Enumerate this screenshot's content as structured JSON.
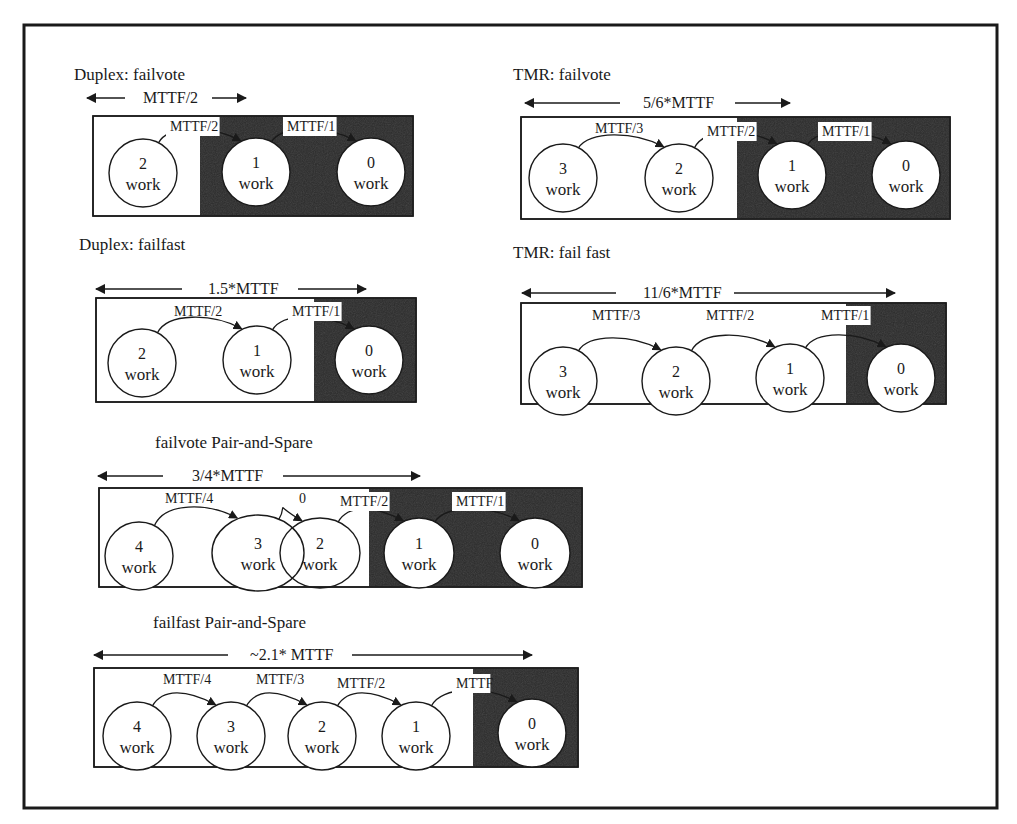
{
  "figure": {
    "frame": {
      "x": 24,
      "y": 25,
      "w": 973,
      "h": 783
    },
    "colors": {
      "dark": "#2a2a2a",
      "line": "#1a1a1a",
      "paper": "#ffffff"
    }
  },
  "diagrams": [
    {
      "id": "duplex-failvote",
      "title": "Duplex: failvote",
      "title_pos": [
        74,
        80
      ],
      "span_label": "MTTF/2",
      "span": {
        "x1": 87,
        "x2": 246,
        "y": 98,
        "label_x": 143,
        "left_end": 125,
        "right_start": 212
      },
      "box": {
        "x": 93,
        "y": 116,
        "w": 320,
        "h": 100
      },
      "dark_from": 200,
      "nodes": [
        {
          "num": "2",
          "word": "work",
          "cx": 143,
          "cy": 173
        },
        {
          "num": "1",
          "word": "work",
          "cx": 256,
          "cy": 172
        },
        {
          "num": "0",
          "word": "work",
          "cx": 371,
          "cy": 172
        }
      ],
      "rates": [
        {
          "label": "MTTF/2",
          "x": 170,
          "y": 131,
          "bg": true
        },
        {
          "label": "MTTF/1",
          "x": 287,
          "y": 131,
          "bg": true
        }
      ]
    },
    {
      "id": "tmr-failvote",
      "title": "TMR: failvote",
      "title_pos": [
        513,
        80
      ],
      "span_label": "5/6*MTTF",
      "span": {
        "x1": 525,
        "x2": 790,
        "y": 103,
        "label_x": 643,
        "left_end": 620,
        "right_start": 735
      },
      "box": {
        "x": 521,
        "y": 117,
        "w": 429,
        "h": 102
      },
      "dark_from": 737,
      "nodes": [
        {
          "num": "3",
          "word": "work",
          "cx": 563,
          "cy": 178
        },
        {
          "num": "2",
          "word": "work",
          "cx": 679,
          "cy": 178
        },
        {
          "num": "1",
          "word": "work",
          "cx": 792,
          "cy": 175
        },
        {
          "num": "0",
          "word": "work",
          "cx": 906,
          "cy": 175
        }
      ],
      "rates": [
        {
          "label": "MTTF/3",
          "x": 595,
          "y": 133,
          "bg": false
        },
        {
          "label": "MTTF/2",
          "x": 707,
          "y": 136,
          "bg": true
        },
        {
          "label": "MTTF/1",
          "x": 822,
          "y": 136,
          "bg": true
        }
      ]
    },
    {
      "id": "duplex-failfast",
      "title": "Duplex: failfast",
      "title_pos": [
        79,
        250
      ],
      "span_label": "1.5*MTTF",
      "span": {
        "x1": 96,
        "x2": 366,
        "y": 289,
        "label_x": 208,
        "left_end": 182,
        "right_start": 298
      },
      "box": {
        "x": 96,
        "y": 298,
        "w": 320,
        "h": 104
      },
      "dark_from": 314,
      "nodes": [
        {
          "num": "2",
          "word": "work",
          "cx": 142,
          "cy": 363
        },
        {
          "num": "1",
          "word": "work",
          "cx": 257,
          "cy": 360
        },
        {
          "num": "0",
          "word": "work",
          "cx": 369,
          "cy": 360
        }
      ],
      "rates": [
        {
          "label": "MTTF/2",
          "x": 174,
          "y": 316,
          "bg": false
        },
        {
          "label": "MTTF/1",
          "x": 292,
          "y": 316,
          "bg": true
        }
      ]
    },
    {
      "id": "tmr-failfast",
      "title": "TMR: fail fast",
      "title_pos": [
        513,
        258
      ],
      "span_label": "11/6*MTTF",
      "span": {
        "x1": 522,
        "x2": 895,
        "y": 293,
        "label_x": 643,
        "left_end": 616,
        "right_start": 734
      },
      "box": {
        "x": 521,
        "y": 303,
        "w": 425,
        "h": 101
      },
      "dark_from": 846,
      "nodes": [
        {
          "num": "3",
          "word": "work",
          "cx": 563,
          "cy": 381
        },
        {
          "num": "2",
          "word": "work",
          "cx": 676,
          "cy": 381
        },
        {
          "num": "1",
          "word": "work",
          "cx": 790,
          "cy": 378
        },
        {
          "num": "0",
          "word": "work",
          "cx": 901,
          "cy": 378
        }
      ],
      "rates": [
        {
          "label": "MTTF/3",
          "x": 592,
          "y": 320,
          "bg": false
        },
        {
          "label": "MTTF/2",
          "x": 706,
          "y": 320,
          "bg": false
        },
        {
          "label": "MTTF/1",
          "x": 821,
          "y": 320,
          "bg": true
        }
      ]
    },
    {
      "id": "failvote-pair-and-spare",
      "title": "failvote   Pair-and-Spare",
      "title_pos": [
        155,
        448
      ],
      "span_label": "3/4*MTTF",
      "span": {
        "x1": 98,
        "x2": 420,
        "y": 476,
        "label_x": 192,
        "left_end": 163,
        "right_start": 283
      },
      "box": {
        "x": 99,
        "y": 488,
        "w": 483,
        "h": 99
      },
      "dark_from": 369,
      "nodes": [
        {
          "num": "4",
          "word": "work",
          "cx": 139,
          "cy": 556,
          "rx": 34,
          "ry": 34
        },
        {
          "num": "3",
          "word": "work",
          "cx": 258,
          "cy": 553,
          "rx": 46,
          "ry": 38
        },
        {
          "num": "2",
          "word": "work",
          "cx": 320,
          "cy": 553,
          "rx": 40,
          "ry": 35
        },
        {
          "num": "1",
          "word": "work",
          "cx": 419,
          "cy": 553,
          "rx": 35,
          "ry": 35
        },
        {
          "num": "0",
          "word": "work",
          "cx": 535,
          "cy": 553,
          "rx": 35,
          "ry": 35
        }
      ],
      "rates": [
        {
          "label": "MTTF/4",
          "x": 165,
          "y": 503,
          "bg": false
        },
        {
          "label": "0",
          "x": 299,
          "y": 503,
          "bg": false
        },
        {
          "label": "MTTF/2",
          "x": 340,
          "y": 506,
          "bg": true
        },
        {
          "label": "MTTF/1",
          "x": 456,
          "y": 506,
          "bg": true
        }
      ]
    },
    {
      "id": "failfast-pair-and-spare",
      "title": "failfast      Pair-and-Spare",
      "title_pos": [
        153,
        628
      ],
      "span_label": "~2.1* MTTF",
      "span": {
        "x1": 94,
        "x2": 532,
        "y": 655,
        "label_x": 250,
        "left_end": 228,
        "right_start": 352
      },
      "box": {
        "x": 94,
        "y": 668,
        "w": 484,
        "h": 99
      },
      "dark_from": 473,
      "nodes": [
        {
          "num": "4",
          "word": "work",
          "cx": 137,
          "cy": 736
        },
        {
          "num": "3",
          "word": "work",
          "cx": 231,
          "cy": 736
        },
        {
          "num": "2",
          "word": "work",
          "cx": 322,
          "cy": 736
        },
        {
          "num": "1",
          "word": "work",
          "cx": 416,
          "cy": 736
        },
        {
          "num": "0",
          "word": "work",
          "cx": 532,
          "cy": 733
        }
      ],
      "rates": [
        {
          "label": "MTTF/4",
          "x": 163,
          "y": 684,
          "bg": false
        },
        {
          "label": "MTTF/3",
          "x": 256,
          "y": 684,
          "bg": false
        },
        {
          "label": "MTTF/2",
          "x": 337,
          "y": 688,
          "bg": false
        },
        {
          "label": "MTTF",
          "x": 456,
          "y": 688,
          "bg": true
        }
      ]
    }
  ]
}
